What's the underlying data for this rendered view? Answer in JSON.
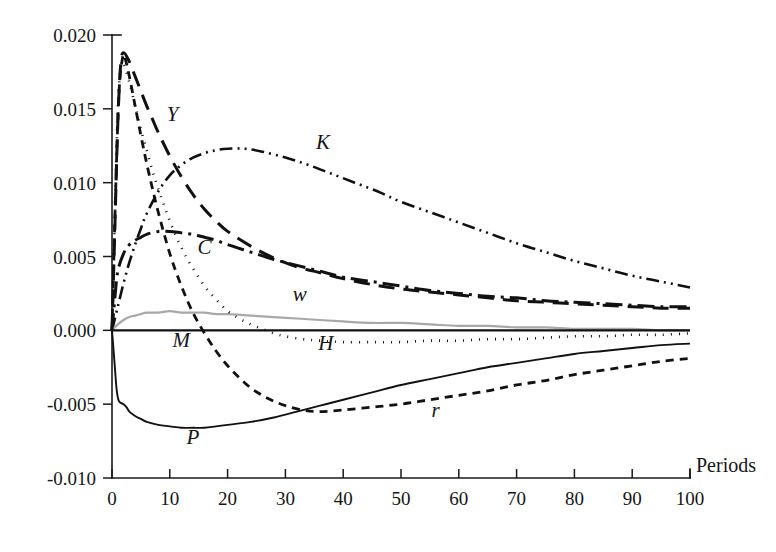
{
  "chart_data": {
    "type": "line",
    "title": "",
    "subtitle": "",
    "xlabel": "Periods",
    "ylabel": "",
    "xlim": [
      0,
      100
    ],
    "ylim": [
      -0.01,
      0.02
    ],
    "grid": false,
    "legend_position": "inline-labels",
    "x_ticks": [
      0,
      10,
      20,
      30,
      40,
      50,
      60,
      70,
      80,
      90,
      100
    ],
    "x_tick_labels": [
      "0",
      "10",
      "20",
      "30",
      "40",
      "50",
      "60",
      "70",
      "80",
      "90",
      "100"
    ],
    "y_ticks": [
      -0.01,
      -0.005,
      0.0,
      0.005,
      0.01,
      0.015,
      0.02
    ],
    "y_tick_labels": [
      "-0.010",
      "-0.005",
      "0.000",
      "0.005",
      "0.010",
      "0.015",
      "0.020"
    ],
    "annotations": [
      {
        "text": "Y",
        "x": 10.5,
        "y": 0.0142
      },
      {
        "text": "K",
        "x": 36.5,
        "y": 0.0123
      },
      {
        "text": "C",
        "x": 16.0,
        "y": 0.0052
      },
      {
        "text": "w",
        "x": 32.5,
        "y": 0.002
      },
      {
        "text": "M",
        "x": 12.0,
        "y": -0.0011
      },
      {
        "text": "H",
        "x": 37.0,
        "y": -0.0013
      },
      {
        "text": "P",
        "x": 14.0,
        "y": -0.0077
      },
      {
        "text": "r",
        "x": 56.0,
        "y": -0.0059
      }
    ],
    "series": [
      {
        "name": "Y",
        "label": "Y",
        "style": "long-dash",
        "color": "#111111",
        "width": 3.0,
        "dash": "16,9",
        "points": [
          [
            0,
            0.0
          ],
          [
            0.5,
            0.007
          ],
          [
            1,
            0.014
          ],
          [
            1.5,
            0.018
          ],
          [
            2,
            0.0188
          ],
          [
            3,
            0.0182
          ],
          [
            4,
            0.0172
          ],
          [
            5,
            0.0162
          ],
          [
            6,
            0.0152
          ],
          [
            7,
            0.0143
          ],
          [
            8,
            0.0134
          ],
          [
            10,
            0.0118
          ],
          [
            12,
            0.0104
          ],
          [
            14,
            0.0092
          ],
          [
            16,
            0.0082
          ],
          [
            18,
            0.0074
          ],
          [
            20,
            0.0067
          ],
          [
            24,
            0.0057
          ],
          [
            28,
            0.0049
          ],
          [
            32,
            0.0043
          ],
          [
            36,
            0.0039
          ],
          [
            40,
            0.0035
          ],
          [
            45,
            0.0031
          ],
          [
            50,
            0.0028
          ],
          [
            55,
            0.0026
          ],
          [
            60,
            0.0024
          ],
          [
            65,
            0.0022
          ],
          [
            70,
            0.002
          ],
          [
            75,
            0.0019
          ],
          [
            80,
            0.0018
          ],
          [
            85,
            0.0017
          ],
          [
            90,
            0.0016
          ],
          [
            95,
            0.0015
          ],
          [
            100,
            0.0015
          ]
        ]
      },
      {
        "name": "K",
        "label": "K",
        "style": "dash-dot-dot",
        "color": "#111111",
        "width": 2.6,
        "dash": "13,5,2,5,2,5",
        "points": [
          [
            0,
            0.0
          ],
          [
            1,
            0.0016
          ],
          [
            2,
            0.0032
          ],
          [
            3,
            0.0046
          ],
          [
            4,
            0.0058
          ],
          [
            5,
            0.0069
          ],
          [
            6,
            0.0079
          ],
          [
            8,
            0.0094
          ],
          [
            10,
            0.0105
          ],
          [
            12,
            0.0112
          ],
          [
            14,
            0.0117
          ],
          [
            16,
            0.012
          ],
          [
            18,
            0.0122
          ],
          [
            20,
            0.0123
          ],
          [
            23,
            0.0123
          ],
          [
            26,
            0.0121
          ],
          [
            30,
            0.0117
          ],
          [
            34,
            0.0112
          ],
          [
            38,
            0.0106
          ],
          [
            42,
            0.01
          ],
          [
            46,
            0.0094
          ],
          [
            50,
            0.0087
          ],
          [
            55,
            0.008
          ],
          [
            60,
            0.0073
          ],
          [
            65,
            0.0066
          ],
          [
            70,
            0.0059
          ],
          [
            75,
            0.0053
          ],
          [
            80,
            0.0047
          ],
          [
            85,
            0.0042
          ],
          [
            90,
            0.0037
          ],
          [
            95,
            0.0033
          ],
          [
            100,
            0.0029
          ]
        ]
      },
      {
        "name": "C",
        "label": "C",
        "style": "dash-dot",
        "color": "#111111",
        "width": 3.0,
        "dash": "17,6,3,6",
        "points": [
          [
            0,
            0.0
          ],
          [
            0.5,
            0.0022
          ],
          [
            1,
            0.004
          ],
          [
            2,
            0.0052
          ],
          [
            3,
            0.0058
          ],
          [
            4,
            0.0061
          ],
          [
            5,
            0.0063
          ],
          [
            6,
            0.0065
          ],
          [
            8,
            0.0067
          ],
          [
            10,
            0.0067
          ],
          [
            12,
            0.0066
          ],
          [
            14,
            0.0065
          ],
          [
            16,
            0.0063
          ],
          [
            18,
            0.0061
          ],
          [
            20,
            0.0058
          ],
          [
            24,
            0.0053
          ],
          [
            28,
            0.0048
          ],
          [
            32,
            0.0044
          ],
          [
            36,
            0.004
          ],
          [
            40,
            0.0036
          ],
          [
            45,
            0.0033
          ],
          [
            50,
            0.003
          ],
          [
            55,
            0.0027
          ],
          [
            60,
            0.0025
          ],
          [
            65,
            0.0023
          ],
          [
            70,
            0.0022
          ],
          [
            75,
            0.002
          ],
          [
            80,
            0.0019
          ],
          [
            85,
            0.0018
          ],
          [
            90,
            0.0017
          ],
          [
            95,
            0.0016
          ],
          [
            100,
            0.0016
          ]
        ]
      },
      {
        "name": "w",
        "label": "w",
        "style": "solid-light",
        "color": "#a8a8a8",
        "width": 2.2,
        "dash": "",
        "points": [
          [
            0,
            0.0
          ],
          [
            1,
            0.0004
          ],
          [
            2,
            0.0007
          ],
          [
            3,
            0.0009
          ],
          [
            4,
            0.001
          ],
          [
            5,
            0.0011
          ],
          [
            6,
            0.0012
          ],
          [
            8,
            0.0012
          ],
          [
            10,
            0.0013
          ],
          [
            12,
            0.0012
          ],
          [
            14,
            0.0012
          ],
          [
            16,
            0.0012
          ],
          [
            18,
            0.0011
          ],
          [
            20,
            0.0011
          ],
          [
            24,
            0.001
          ],
          [
            28,
            0.0009
          ],
          [
            32,
            0.0008
          ],
          [
            36,
            0.0007
          ],
          [
            40,
            0.0006
          ],
          [
            45,
            0.0005
          ],
          [
            50,
            0.0005
          ],
          [
            55,
            0.0004
          ],
          [
            60,
            0.0003
          ],
          [
            65,
            0.0003
          ],
          [
            70,
            0.0002
          ],
          [
            75,
            0.0002
          ],
          [
            80,
            0.0001
          ],
          [
            85,
            0.0001
          ],
          [
            90,
            0.0001
          ],
          [
            95,
            0.0
          ],
          [
            100,
            0.0
          ]
        ]
      },
      {
        "name": "M",
        "label": "M",
        "style": "solid-flat",
        "color": "#111111",
        "width": 2.2,
        "dash": "",
        "points": [
          [
            0,
            0.0
          ],
          [
            10,
            0.0
          ],
          [
            20,
            0.0
          ],
          [
            30,
            0.0
          ],
          [
            40,
            0.0
          ],
          [
            50,
            0.0
          ],
          [
            60,
            0.0
          ],
          [
            70,
            0.0
          ],
          [
            80,
            0.0
          ],
          [
            90,
            0.0
          ],
          [
            100,
            0.0
          ]
        ]
      },
      {
        "name": "H",
        "label": "H",
        "style": "dotted",
        "color": "#111111",
        "width": 2.6,
        "dash": "1,7",
        "points": [
          [
            0,
            0.0
          ],
          [
            0.5,
            0.008
          ],
          [
            1,
            0.015
          ],
          [
            1.5,
            0.0178
          ],
          [
            2,
            0.018
          ],
          [
            3,
            0.0168
          ],
          [
            4,
            0.0152
          ],
          [
            5,
            0.0136
          ],
          [
            6,
            0.0122
          ],
          [
            7,
            0.0108
          ],
          [
            8,
            0.0096
          ],
          [
            10,
            0.0074
          ],
          [
            12,
            0.0056
          ],
          [
            14,
            0.0042
          ],
          [
            16,
            0.003
          ],
          [
            18,
            0.0021
          ],
          [
            20,
            0.0013
          ],
          [
            22,
            0.0008
          ],
          [
            24,
            0.0004
          ],
          [
            26,
            0.0001
          ],
          [
            28,
            -0.0002
          ],
          [
            30,
            -0.0004
          ],
          [
            33,
            -0.0006
          ],
          [
            36,
            -0.0007
          ],
          [
            40,
            -0.0008
          ],
          [
            45,
            -0.0008
          ],
          [
            50,
            -0.0008
          ],
          [
            55,
            -0.0007
          ],
          [
            60,
            -0.0007
          ],
          [
            65,
            -0.0006
          ],
          [
            70,
            -0.0006
          ],
          [
            75,
            -0.0005
          ],
          [
            80,
            -0.0004
          ],
          [
            85,
            -0.0004
          ],
          [
            90,
            -0.0003
          ],
          [
            95,
            -0.0003
          ],
          [
            100,
            -0.0002
          ]
        ]
      },
      {
        "name": "P",
        "label": "P",
        "style": "solid",
        "color": "#111111",
        "width": 1.9,
        "dash": "",
        "points": [
          [
            0,
            0.0
          ],
          [
            0.4,
            -0.002
          ],
          [
            0.8,
            -0.004
          ],
          [
            1.2,
            -0.0048
          ],
          [
            2,
            -0.005
          ],
          [
            2.5,
            -0.0052
          ],
          [
            3,
            -0.0055
          ],
          [
            4,
            -0.0058
          ],
          [
            5,
            -0.006
          ],
          [
            6,
            -0.0062
          ],
          [
            8,
            -0.0064
          ],
          [
            10,
            -0.0065
          ],
          [
            12,
            -0.0066
          ],
          [
            14,
            -0.0066
          ],
          [
            16,
            -0.0066
          ],
          [
            18,
            -0.0065
          ],
          [
            20,
            -0.0064
          ],
          [
            24,
            -0.0062
          ],
          [
            28,
            -0.0059
          ],
          [
            32,
            -0.0055
          ],
          [
            36,
            -0.0051
          ],
          [
            40,
            -0.0047
          ],
          [
            45,
            -0.0042
          ],
          [
            50,
            -0.0037
          ],
          [
            55,
            -0.0033
          ],
          [
            60,
            -0.0029
          ],
          [
            65,
            -0.0025
          ],
          [
            70,
            -0.0022
          ],
          [
            75,
            -0.0019
          ],
          [
            80,
            -0.0016
          ],
          [
            85,
            -0.0014
          ],
          [
            90,
            -0.0012
          ],
          [
            95,
            -0.001
          ],
          [
            100,
            -0.0009
          ]
        ]
      },
      {
        "name": "r",
        "label": "r",
        "style": "short-dash",
        "color": "#111111",
        "width": 2.8,
        "dash": "8,6",
        "points": [
          [
            0,
            0.0
          ],
          [
            0.6,
            0.009
          ],
          [
            1.2,
            0.016
          ],
          [
            1.8,
            0.0184
          ],
          [
            2.2,
            0.0185
          ],
          [
            3,
            0.0172
          ],
          [
            4,
            0.0152
          ],
          [
            5,
            0.0132
          ],
          [
            6,
            0.0113
          ],
          [
            7,
            0.0096
          ],
          [
            8,
            0.008
          ],
          [
            10,
            0.0052
          ],
          [
            12,
            0.003
          ],
          [
            14,
            0.0012
          ],
          [
            16,
            -0.0002
          ],
          [
            18,
            -0.0014
          ],
          [
            20,
            -0.0024
          ],
          [
            22,
            -0.0032
          ],
          [
            24,
            -0.0039
          ],
          [
            26,
            -0.0044
          ],
          [
            28,
            -0.0048
          ],
          [
            30,
            -0.0051
          ],
          [
            33,
            -0.0054
          ],
          [
            36,
            -0.0055
          ],
          [
            40,
            -0.0054
          ],
          [
            45,
            -0.0052
          ],
          [
            50,
            -0.005
          ],
          [
            55,
            -0.0047
          ],
          [
            60,
            -0.0044
          ],
          [
            65,
            -0.0041
          ],
          [
            70,
            -0.0037
          ],
          [
            75,
            -0.0034
          ],
          [
            80,
            -0.003
          ],
          [
            85,
            -0.0027
          ],
          [
            90,
            -0.0024
          ],
          [
            95,
            -0.0021
          ],
          [
            100,
            -0.0019
          ]
        ]
      }
    ]
  }
}
